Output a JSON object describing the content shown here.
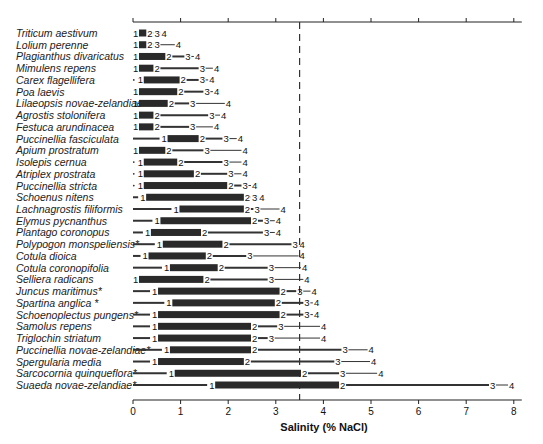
{
  "chart_data": {
    "type": "bar",
    "subtype": "range-bar (germination salinity tolerance, markers 1-4)",
    "title": "",
    "xlabel": "Salinity (% NaCl)",
    "ylabel": "",
    "xlim": [
      0,
      8
    ],
    "xticks": [
      0,
      1,
      2,
      3,
      4,
      5,
      6,
      7,
      8
    ],
    "reference_line": {
      "x": 3.5,
      "style": "dashed"
    },
    "legend": "Markers 1, 2, 3, 4 mark successive salinity thresholds; thick bar spans 1 to 2, thin line 2 to 4; * marks halophyte/introduced species",
    "marker_labels": [
      "1",
      "2",
      "3",
      "4"
    ],
    "categories": [
      "Triticum aestivum",
      "Lolium perenne",
      "Plagianthus divaricatus",
      "Mimulens repens",
      "Carex flagellifera",
      "Poa laevis",
      "Lilaeopsis novae-zelandiae",
      "Agrostis stolonifera",
      "Festuca arundinacea",
      "Puccinellia fasciculata",
      "Apium prostratum",
      "Isolepis cernua",
      "Atriplex prostrata",
      "Puccinellia stricta",
      "Schoenus nitens",
      "Lachnagrostis filiformis",
      "Elymus pycnanthus",
      "Plantago coronopus",
      "Polypogon monspeliensis*",
      "Cotula dioica",
      "Cotula coronopifolia",
      "Selliera radicans",
      "Juncus maritimus*",
      "Spartina anglica *",
      "Schoenoplectus pungens*",
      "Samolus repens",
      "Triglochin striatum",
      "Puccinellia novae-zelandiae*",
      "Spergularia media",
      "Sarcocornia quinqueflora*",
      "Suaeda novae-zelandiae*"
    ],
    "series": [
      {
        "name": "1",
        "values": [
          0.0,
          0.0,
          0.0,
          0.0,
          0.1,
          0.0,
          0.0,
          0.0,
          0.0,
          0.6,
          0.0,
          0.1,
          0.1,
          0.1,
          0.15,
          0.85,
          0.45,
          0.25,
          0.5,
          0.2,
          0.65,
          0.0,
          0.4,
          0.7,
          0.4,
          0.4,
          0.4,
          0.65,
          0.4,
          0.75,
          1.6
        ]
      },
      {
        "name": "2",
        "values": [
          0.3,
          0.3,
          0.7,
          0.45,
          1.0,
          0.95,
          0.75,
          0.45,
          0.45,
          1.4,
          0.7,
          0.95,
          1.3,
          2.0,
          2.35,
          2.35,
          2.5,
          1.45,
          1.9,
          1.55,
          1.8,
          1.5,
          3.1,
          3.0,
          3.1,
          2.5,
          2.5,
          2.5,
          2.35,
          3.55,
          4.35
        ]
      },
      {
        "name": "3",
        "values": [
          0.45,
          0.45,
          1.1,
          1.4,
          1.4,
          1.5,
          1.2,
          1.6,
          1.2,
          1.9,
          1.5,
          1.9,
          2.0,
          2.3,
          2.5,
          2.55,
          2.75,
          2.75,
          3.35,
          2.4,
          2.85,
          2.85,
          3.45,
          3.6,
          3.6,
          3.05,
          2.85,
          4.4,
          4.25,
          4.35,
          7.5
        ]
      },
      {
        "name": "4",
        "values": [
          0.6,
          0.9,
          1.3,
          1.7,
          1.6,
          1.7,
          1.95,
          1.85,
          1.7,
          2.2,
          2.3,
          2.3,
          2.3,
          2.5,
          2.65,
          3.1,
          3.0,
          3.0,
          3.5,
          3.5,
          3.55,
          3.6,
          3.75,
          3.8,
          3.8,
          3.95,
          3.95,
          4.95,
          5.0,
          5.15,
          7.9
        ]
      }
    ],
    "lead_line_from_zero": [
      false,
      false,
      false,
      false,
      false,
      false,
      false,
      false,
      false,
      true,
      false,
      false,
      false,
      false,
      true,
      true,
      true,
      true,
      true,
      true,
      true,
      false,
      true,
      true,
      true,
      true,
      true,
      true,
      true,
      true,
      true
    ]
  },
  "colors": {
    "bar": "#2a2a2a",
    "line": "#333333",
    "axis": "#222222",
    "dashed_line": "#333333"
  }
}
